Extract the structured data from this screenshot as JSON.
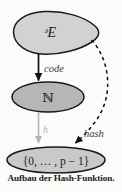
{
  "figure": {
    "caption": "Aufbau der Hash-Funktion.",
    "nodes": [
      {
        "id": "domain",
        "label": "ᵊE",
        "shape": "blob",
        "fill": "#d2d2d2"
      },
      {
        "id": "naturals",
        "label": "ℕ",
        "shape": "ellipse",
        "fill": "#b6b6b6"
      },
      {
        "id": "residues",
        "label": "{0, … , p − 1}",
        "shape": "ellipse",
        "fill": "#c9c9c9"
      }
    ],
    "edges": [
      {
        "id": "code",
        "label": "code",
        "style": "solid",
        "color": "#111111",
        "from": "domain",
        "to": "naturals"
      },
      {
        "id": "h",
        "label": "h",
        "style": "solid",
        "color": "#b4b4b4",
        "from": "naturals",
        "to": "residues"
      },
      {
        "id": "hash",
        "label": "hash",
        "style": "dashed",
        "color": "#0d0d0d",
        "from": "domain",
        "to": "residues"
      }
    ]
  },
  "labels": {
    "domain_symbol": "ᵊE",
    "naturals_symbol": "ℕ",
    "residues_symbol": "{0, … , p − 1}",
    "code_label": "code",
    "h_label": "h",
    "hash_label": "hash"
  },
  "colors": {
    "background": "#fbfbfa",
    "outline": "#1a1a1a",
    "blob_fill": "#d2d2d2",
    "naturals_fill": "#b6b6b6",
    "residues_fill": "#c9c9c9",
    "faint_arrow": "#b4b4b4",
    "text": "#1c1c1c"
  }
}
